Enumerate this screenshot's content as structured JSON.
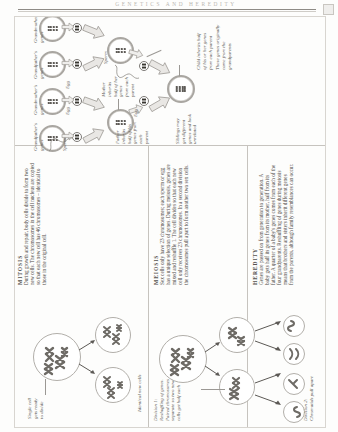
{
  "page": {
    "running_head": "GENETICS AND HEREDITY",
    "folio_icon": "page-corner-icon"
  },
  "family_tree": {
    "labels": {
      "grandfather": "Grandfather's\ngenes",
      "grandmother": "Grandmother's\ngenes",
      "grandfather2": "Grandfather's\ngenes",
      "grandmother2": "Grandmother's\ngenes",
      "sperm1": "Sperm",
      "sperm2": "Sperm",
      "egg1": "Egg",
      "egg2": "Egg",
      "egg3": "Egg",
      "mother": "Mother\ninherits\nhalf of her\ngenes\nfrom each\nparent",
      "father": "Father\ninherits\nhalf of his\ngenes from\neach\nparent",
      "child": "Child inherits half\nof his or her genes\nfrom each parent",
      "child_note": "These genes originally\ncame from the\ngrandparents",
      "sibling": "Siblings may\nget different\ngenes and look\nunrelated"
    }
  },
  "columns": {
    "mitosis": {
      "heading": "MITOSIS",
      "body": "During growth and repair, body cells divide to form two new cells. The chromosomes in the cell nucleus are copied so that each new cell has 46 chromosomes – identical to those in the original cell."
    },
    "meiosis": {
      "heading": "MEIOSIS",
      "body": "Sex cells only have 23 chromosomes; each sperm or egg has a unique selection of genes. During meiosis, genes are mixed and reshuffle 1. The cell divides so that each new cell only receives 23 chromosomes. In a second division the chromosomes pull apart to form another two sex cells."
    },
    "heredity": {
      "heading": "HEREDITY",
      "body": "Genes are passed on from generation to generation. A baby gets half its genes from its mother, half from its father. A quarter of a baby's genes comes from each of the four grandparents. Reshuffling of genes during meiosis means that brothers and sisters inherit different genes from the parents, although family resemblances can occur."
    }
  },
  "figure_labels": {
    "single_cell": "Single cell\ngets ready\nto divide",
    "identical_new_cells": "Identical new cells",
    "division1": "Division 1:\nReshuffling of genes.\nPaired chromosomes\nseparate so two new\ncells get half each",
    "division2": "Division 2:\nChromatids pull apart"
  },
  "colors": {
    "ink": "#4a4743",
    "rule": "#8e8b86",
    "cell_ring": "#a9a6a1",
    "chromosome": "#6e6b66",
    "paper": "#fdfdfc"
  }
}
